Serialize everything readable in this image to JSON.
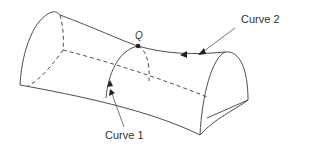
{
  "figure": {
    "point_label": "Q",
    "curve1_label": "Curve 1",
    "curve2_label": "Curve 2",
    "colors": {
      "line": "#3a3a3a",
      "background": "#ffffff"
    }
  }
}
